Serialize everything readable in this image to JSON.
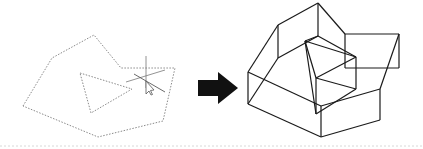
{
  "diagram": {
    "colors": {
      "background": "#ffffff",
      "profile_stroke": "#8a8a8a",
      "wireframe_stroke": "#1a1a1a",
      "arrow_fill": "#111111",
      "baseline": "#d8d8d8"
    },
    "left_profile": {
      "outer_polygon": "23,106 52,58 94,35 121,68 175,68 163,121 98,137",
      "inner_triangle": "80,73 132,89 91,113"
    },
    "cursor": {
      "x": 146,
      "y": 81
    },
    "arrow": {
      "points": "198,80 218,80 218,72 238,88 218,104 218,96 198,96"
    },
    "wireframe": {
      "lines": [
        "248,72 278,25",
        "278,25 318,3",
        "318,3 345,34",
        "345,34 399,34",
        "399,34 399,68",
        "399,68 345,68",
        "345,34 345,68",
        "278,25 278,58",
        "318,3 318,36",
        "318,36 278,58",
        "248,72 248,104",
        "248,104 321,137",
        "321,137 380,120",
        "380,120 380,89",
        "380,89 399,34",
        "248,72 321,106",
        "321,106 321,137",
        "321,106 380,89",
        "248,104 278,58",
        "305,41 356,57",
        "356,57 316,78",
        "316,78 305,41",
        "305,41 318,36",
        "318,36 356,57",
        "305,41 316,114",
        "316,78 316,114",
        "356,57 356,89",
        "356,89 316,114",
        "316,78 356,89"
      ]
    }
  }
}
